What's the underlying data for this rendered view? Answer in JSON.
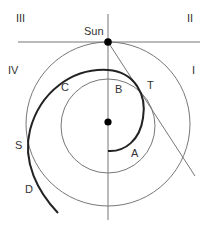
{
  "diagram": {
    "quadrants": {
      "I": "I",
      "II": "II",
      "III": "III",
      "IV": "IV"
    },
    "points": {
      "sun": "Sun",
      "A": "A",
      "B": "B",
      "C": "C",
      "D": "D",
      "S": "S",
      "T": "T"
    },
    "colors": {
      "thin_line": "#777777",
      "thick_curve": "#222222",
      "dot": "#000000",
      "background": "#ffffff"
    }
  }
}
